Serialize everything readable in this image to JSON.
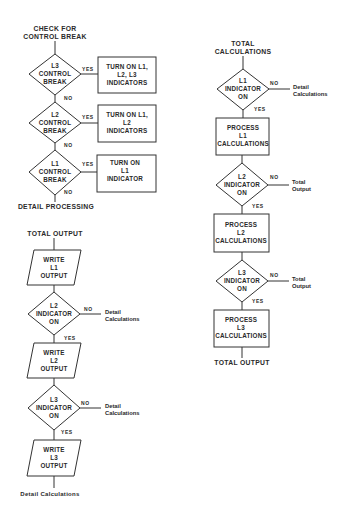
{
  "left_top": {
    "start": [
      "CHECK FOR",
      "CONTROL BREAK"
    ],
    "decisions": [
      {
        "lines": [
          "L3",
          "CONTROL",
          "BREAK"
        ],
        "yes": "YES",
        "no": "NO",
        "action": [
          "TURN ON L1,",
          "L2, L3",
          "INDICATORS"
        ]
      },
      {
        "lines": [
          "L2",
          "CONTROL",
          "BREAK"
        ],
        "yes": "YES",
        "no": "NO",
        "action": [
          "TURN ON L1,",
          "L2",
          "INDICATORS"
        ]
      },
      {
        "lines": [
          "L1",
          "CONTROL",
          "BREAK"
        ],
        "yes": "YES",
        "no": "NO",
        "action": [
          "TURN ON",
          "L1",
          "INDICATOR"
        ]
      }
    ],
    "end": "DETAIL PROCESSING"
  },
  "left_bottom": {
    "start": "TOTAL OUTPUT",
    "outputs": [
      [
        "WRITE",
        "L1",
        "OUTPUT"
      ],
      [
        "WRITE",
        "L2",
        "OUTPUT"
      ],
      [
        "WRITE",
        "L3",
        "OUTPUT"
      ]
    ],
    "decisions": [
      {
        "lines": [
          "L2",
          "INDICATOR",
          "ON"
        ],
        "no": "NO",
        "yes": "YES",
        "no_target": [
          "Detail",
          "Calculations"
        ]
      },
      {
        "lines": [
          "L3",
          "INDICATOR",
          "ON"
        ],
        "no": "NO",
        "yes": "YES",
        "no_target": [
          "Detail",
          "Calculations"
        ]
      }
    ],
    "end": "Detail Calculations"
  },
  "right": {
    "start": [
      "TOTAL",
      "CALCULATIONS"
    ],
    "decisions": [
      {
        "lines": [
          "L1",
          "INDICATOR",
          "ON"
        ],
        "no": "NO",
        "yes": "YES",
        "no_target": [
          "Detail",
          "Calculations"
        ]
      },
      {
        "lines": [
          "L2",
          "INDICATOR",
          "ON"
        ],
        "no": "NO",
        "yes": "YES",
        "no_target": [
          "Total",
          "Output"
        ]
      },
      {
        "lines": [
          "L3",
          "INDICATOR",
          "ON"
        ],
        "no": "NO",
        "yes": "YES",
        "no_target": [
          "Total",
          "Output"
        ]
      }
    ],
    "processes": [
      [
        "PROCESS",
        "L1",
        "CALCULATIONS"
      ],
      [
        "PROCESS",
        "L2",
        "CALCULATIONS"
      ],
      [
        "PROCESS",
        "L3",
        "CALCULATIONS"
      ]
    ],
    "end": "TOTAL OUTPUT"
  },
  "colors": {
    "line": "#333333",
    "text": "#2a2a2a",
    "background": "#ffffff"
  }
}
